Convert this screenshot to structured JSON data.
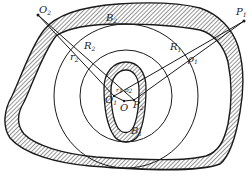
{
  "figure": {
    "colors": {
      "ink": "#1a1a1a",
      "background": "#ffffff",
      "hatch": "#2a2a2a"
    },
    "labels": {
      "O2": {
        "main": "O",
        "sub": "2"
      },
      "B2": {
        "main": "B",
        "sub": "2"
      },
      "P1": {
        "main": "P",
        "sub": "1"
      },
      "R2": {
        "main": "R",
        "sub": "2"
      },
      "r2": {
        "main": "r",
        "sub": "2"
      },
      "R1": {
        "main": "R",
        "sub": "1"
      },
      "rho1": {
        "main": "ρ",
        "sub": "1"
      },
      "r1": {
        "main": "r",
        "sub": "1"
      },
      "rho2": {
        "main": "ρ",
        "sub": "2"
      },
      "O1": {
        "main": "O",
        "sub": "1"
      },
      "O": {
        "main": "O",
        "sub": ""
      },
      "P2": {
        "main": "P",
        "sub": "2"
      },
      "B1": {
        "main": "B",
        "sub": "1"
      }
    }
  }
}
